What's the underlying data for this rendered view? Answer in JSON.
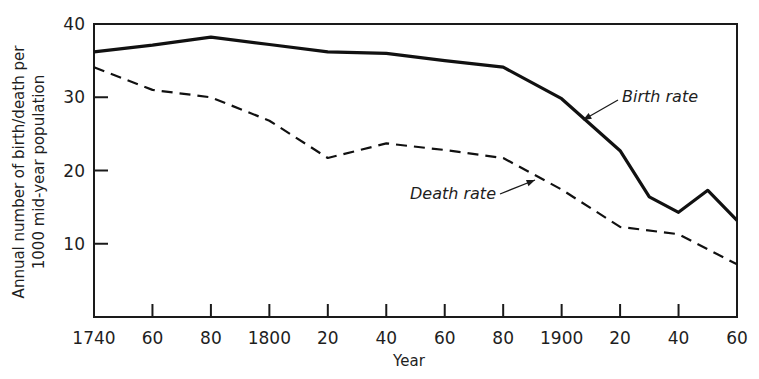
{
  "chart_data": {
    "type": "line",
    "title": "",
    "xlabel": "Year",
    "ylabel": "Annual number of birth/death per 1000 mid-year population",
    "ylabel_lines": [
      "Annual number of birth/death per",
      "1000 mid-year population"
    ],
    "xlim": [
      1740,
      1960
    ],
    "ylim": [
      0,
      40
    ],
    "grid": false,
    "legend": "none (inline annotations with arrows)",
    "x_ticks": [
      1740,
      1760,
      1780,
      1800,
      1820,
      1840,
      1860,
      1880,
      1900,
      1920,
      1940,
      1960
    ],
    "x_tick_labels": [
      "1740",
      "60",
      "80",
      "1800",
      "20",
      "40",
      "60",
      "80",
      "1900",
      "20",
      "40",
      "60"
    ],
    "y_ticks": [
      10,
      20,
      30,
      40
    ],
    "y_tick_labels": [
      "10",
      "20",
      "30",
      "40"
    ],
    "series": [
      {
        "name": "Birth rate",
        "style": "solid",
        "color": "#111111",
        "x": [
          1740,
          1760,
          1780,
          1800,
          1820,
          1840,
          1860,
          1880,
          1900,
          1920,
          1930,
          1940,
          1950,
          1960
        ],
        "values": [
          36.2,
          37.1,
          38.2,
          37.2,
          36.2,
          36.0,
          35.0,
          34.1,
          29.8,
          22.7,
          16.4,
          14.3,
          17.3,
          13.2
        ]
      },
      {
        "name": "Death rate",
        "style": "dashed",
        "color": "#111111",
        "x": [
          1740,
          1760,
          1780,
          1800,
          1820,
          1840,
          1860,
          1880,
          1900,
          1920,
          1940,
          1960
        ],
        "values": [
          34.1,
          31.0,
          30.0,
          26.8,
          21.7,
          23.7,
          22.8,
          21.7,
          17.4,
          12.3,
          11.3,
          7.2
        ]
      }
    ],
    "annotations": [
      {
        "text": "Birth rate",
        "series": "Birth rate",
        "label_pos": [
          622,
          102
        ],
        "arrow_from": [
          618,
          100
        ],
        "arrow_to": [
          583,
          120
        ]
      },
      {
        "text": "Death rate",
        "series": "Death rate",
        "label_pos": [
          410,
          199
        ],
        "arrow_from": [
          500,
          194
        ],
        "arrow_to": [
          535,
          180
        ]
      }
    ]
  }
}
